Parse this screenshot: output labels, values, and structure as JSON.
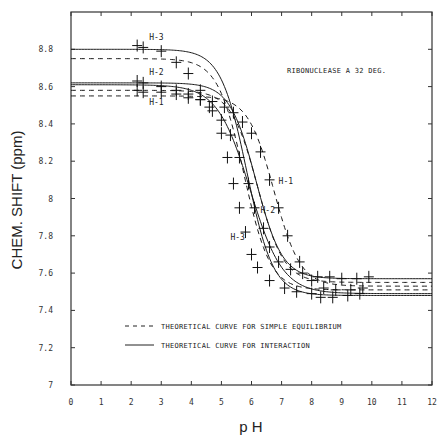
{
  "chart_data": {
    "type": "line",
    "title": "RIBONUCLEASE A 32 DEG.",
    "xlabel": "p H",
    "ylabel": "CHEM. SHIFT (ppm)",
    "xlim": [
      0,
      12
    ],
    "ylim": [
      7,
      9
    ],
    "x_ticks": [
      "0",
      "1",
      "2",
      "3",
      "4",
      "5",
      "6",
      "7",
      "8",
      "9",
      "10",
      "11",
      "12"
    ],
    "y_ticks": [
      "7",
      "7.2",
      "7.4",
      "7.6",
      "7.8",
      "8",
      "8.2",
      "8.4",
      "8.6",
      "8.8"
    ],
    "y_tick_values": [
      7,
      7.2,
      7.4,
      7.6,
      7.8,
      8,
      8.2,
      8.4,
      8.6,
      8.8
    ],
    "grid": false,
    "legend": [
      {
        "style": "dashed",
        "label": "THEORETICAL CURVE FOR SIMPLE EQUILIBRIUM"
      },
      {
        "style": "solid",
        "label": "THEORETICAL CURVE FOR INTERACTION"
      }
    ],
    "legend_position": "lower-center",
    "curve_labels": [
      {
        "text": "H-3",
        "pH": 2.6,
        "ppm": 8.85
      },
      {
        "text": "H-2",
        "pH": 2.6,
        "ppm": 8.66
      },
      {
        "text": "H-1",
        "pH": 2.6,
        "ppm": 8.5
      },
      {
        "text": "H-1",
        "pH": 6.9,
        "ppm": 8.08
      },
      {
        "text": "H-2",
        "pH": 6.3,
        "ppm": 7.92
      },
      {
        "text": "H-3",
        "pH": 5.3,
        "ppm": 7.78
      }
    ],
    "series": [
      {
        "name": "H-3 interaction",
        "style": "solid",
        "low": 8.8,
        "high": 7.48,
        "pKa": 5.85,
        "n": 1.0,
        "xmin": 0,
        "xmax": 12
      },
      {
        "name": "H-2 interaction",
        "style": "solid",
        "low": 8.62,
        "high": 7.57,
        "pKa": 6.15,
        "n": 1.0,
        "xmin": 0,
        "xmax": 12
      },
      {
        "name": "H-1 interaction",
        "style": "solid",
        "low": 8.61,
        "high": 7.49,
        "pKa": 5.95,
        "n": 0.8,
        "xmin": 0,
        "xmax": 12
      },
      {
        "name": "H-3 simple equilibrium",
        "style": "dashed",
        "low": 8.75,
        "high": 7.51,
        "pKa": 5.75,
        "n": 1.0,
        "xmin": 0,
        "xmax": 12
      },
      {
        "name": "H-2 simple equilibrium",
        "style": "dashed",
        "low": 8.58,
        "high": 7.55,
        "pKa": 6.2,
        "n": 1.0,
        "xmin": 0,
        "xmax": 12
      },
      {
        "name": "H-1 simple equilibrium",
        "style": "dashed",
        "low": 8.55,
        "high": 7.53,
        "pKa": 6.75,
        "n": 1.0,
        "xmin": 0,
        "xmax": 12
      }
    ],
    "points": [
      {
        "name": "H-3 data",
        "x": [
          2.2,
          2.4,
          3.0,
          3.5,
          3.9,
          4.3,
          4.6,
          5.0,
          5.2,
          5.4,
          5.6,
          5.8,
          6.0,
          6.2,
          6.6,
          7.1,
          7.5,
          8.0,
          8.3,
          8.7,
          9.2,
          9.6
        ],
        "y": [
          8.82,
          8.81,
          8.79,
          8.73,
          8.67,
          8.58,
          8.49,
          8.35,
          8.22,
          8.08,
          7.95,
          7.82,
          7.7,
          7.63,
          7.56,
          7.52,
          7.5,
          7.49,
          7.47,
          7.47,
          7.48,
          7.49
        ]
      },
      {
        "name": "H-2 data",
        "x": [
          2.2,
          2.4,
          3.0,
          3.5,
          3.9,
          4.3,
          4.7,
          5.0,
          5.3,
          5.6,
          5.9,
          6.1,
          6.4,
          6.6,
          6.9,
          7.3,
          7.7,
          8.2,
          8.6,
          9.0,
          9.5,
          9.9
        ],
        "y": [
          8.63,
          8.62,
          8.6,
          8.58,
          8.56,
          8.53,
          8.47,
          8.42,
          8.34,
          8.22,
          8.08,
          7.95,
          7.84,
          7.74,
          7.66,
          7.62,
          7.6,
          7.58,
          7.58,
          7.57,
          7.57,
          7.58
        ]
      },
      {
        "name": "H-1 data",
        "x": [
          2.2,
          2.4,
          3.0,
          3.5,
          3.9,
          4.3,
          4.7,
          5.1,
          5.4,
          5.7,
          6.0,
          6.3,
          6.6,
          6.9,
          7.2,
          7.6,
          8.0,
          8.4,
          8.8,
          9.3,
          9.7
        ],
        "y": [
          8.58,
          8.57,
          8.57,
          8.56,
          8.54,
          8.53,
          8.52,
          8.49,
          8.46,
          8.41,
          8.35,
          8.25,
          8.1,
          7.95,
          7.8,
          7.66,
          7.56,
          7.52,
          7.51,
          7.51,
          7.52
        ]
      }
    ]
  },
  "axes": {
    "x_title": "p H",
    "y_title": "CHEM. SHIFT (ppm)"
  },
  "annotation": {
    "title": "RIBONUCLEASE A 32 DEG."
  },
  "legend": {
    "dashed_label": "THEORETICAL CURVE FOR SIMPLE EQUILIBRIUM",
    "solid_label": "THEORETICAL CURVE FOR INTERACTION"
  },
  "colors": {
    "ink": "#1a1a1a",
    "axis": "#333333",
    "background": "#ffffff"
  }
}
